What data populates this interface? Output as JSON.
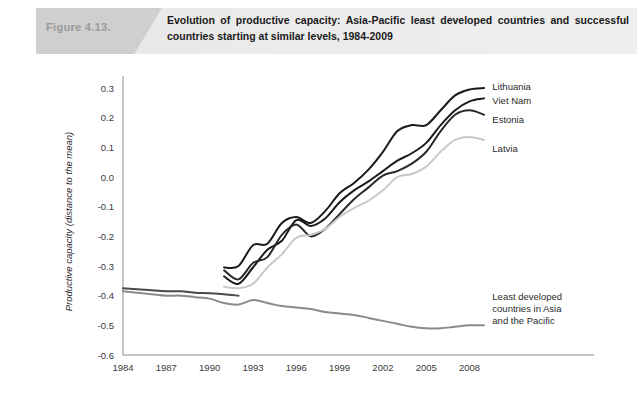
{
  "header": {
    "figure_label": "Figure 4.13.",
    "title": "Evolution of productive capacity: Asia-Pacific least developed countries and successful countries starting at similar levels, 1984-2009",
    "banner_color": "#e9e9e9",
    "tab_color": "#cfcfcf"
  },
  "chart_data": {
    "type": "line",
    "title": "Evolution of productive capacity: Asia-Pacific least developed countries and successful countries starting at similar levels, 1984-2009",
    "xlabel": "",
    "ylabel": "Productive capacity (distance to the mean)",
    "xlim": [
      1984,
      2009
    ],
    "ylim": [
      -0.6,
      0.3
    ],
    "xticks": [
      1984,
      1987,
      1990,
      1993,
      1996,
      1999,
      2002,
      2005,
      2008
    ],
    "yticks": [
      -0.6,
      -0.5,
      -0.4,
      -0.3,
      -0.2,
      -0.1,
      0.0,
      0.1,
      0.2,
      0.3
    ],
    "ytick_labels": [
      "-0.6",
      "-0.5",
      "-0.4",
      "-0.3",
      "-0.2",
      "-0.1",
      "0.0",
      "0.1",
      "0.2",
      "0.3"
    ],
    "grid": false,
    "legend_position": "right-inline-labels",
    "x": [
      1984,
      1985,
      1986,
      1987,
      1988,
      1989,
      1990,
      1991,
      1992,
      1993,
      1994,
      1995,
      1996,
      1997,
      1998,
      1999,
      2000,
      2001,
      2002,
      2003,
      2004,
      2005,
      2006,
      2007,
      2008,
      2009
    ],
    "series": [
      {
        "name": "Lithuania",
        "color": "#1a1a1a",
        "width": 2.0,
        "label_x": 2009.3,
        "label_y": 0.305,
        "x": [
          1991,
          1992,
          1993,
          1994,
          1995,
          1996,
          1997,
          1998,
          1999,
          2000,
          2001,
          2002,
          2003,
          2004,
          2005,
          2006,
          2007,
          2008,
          2009
        ],
        "values": [
          -0.305,
          -0.3,
          -0.23,
          -0.225,
          -0.155,
          -0.135,
          -0.155,
          -0.115,
          -0.055,
          -0.02,
          0.025,
          0.085,
          0.155,
          0.175,
          0.175,
          0.225,
          0.275,
          0.295,
          0.3
        ]
      },
      {
        "name": "Viet Nam",
        "color": "#1a1a1a",
        "width": 2.0,
        "label_x": 2009.3,
        "label_y": 0.258,
        "x": [
          1991,
          1992,
          1993,
          1994,
          1995,
          1996,
          1997,
          1998,
          1999,
          2000,
          2001,
          2002,
          2003,
          2004,
          2005,
          2006,
          2007,
          2008,
          2009
        ],
        "values": [
          -0.335,
          -0.36,
          -0.305,
          -0.245,
          -0.215,
          -0.145,
          -0.165,
          -0.14,
          -0.085,
          -0.045,
          -0.015,
          0.02,
          0.055,
          0.08,
          0.115,
          0.175,
          0.225,
          0.255,
          0.265
        ]
      },
      {
        "name": "Estonia",
        "color": "#2a2a2a",
        "width": 2.0,
        "label_x": 2009.3,
        "label_y": 0.195,
        "x": [
          1991,
          1992,
          1993,
          1994,
          1995,
          1996,
          1997,
          1998,
          1999,
          2000,
          2001,
          2002,
          2003,
          2004,
          2005,
          2006,
          2007,
          2008,
          2009
        ],
        "values": [
          -0.315,
          -0.345,
          -0.29,
          -0.27,
          -0.195,
          -0.16,
          -0.2,
          -0.175,
          -0.125,
          -0.075,
          -0.035,
          0.005,
          0.02,
          0.045,
          0.085,
          0.155,
          0.21,
          0.225,
          0.21
        ]
      },
      {
        "name": "Latvia",
        "color": "#c9c9c9",
        "width": 2.0,
        "label_x": 2009.3,
        "label_y": 0.095,
        "x": [
          1991,
          1992,
          1993,
          1994,
          1995,
          1996,
          1997,
          1998,
          1999,
          2000,
          2001,
          2002,
          2003,
          2004,
          2005,
          2006,
          2007,
          2008,
          2009
        ],
        "values": [
          -0.37,
          -0.375,
          -0.36,
          -0.305,
          -0.26,
          -0.205,
          -0.195,
          -0.175,
          -0.135,
          -0.105,
          -0.08,
          -0.045,
          0.0,
          0.01,
          0.035,
          0.085,
          0.125,
          0.135,
          0.125
        ]
      },
      {
        "name": "Least developed countries in Asia and the Pacific",
        "color": "#8a8a8a",
        "width": 2.0,
        "label_x": 2009.3,
        "label_y": -0.415,
        "x": [
          1984,
          1985,
          1986,
          1987,
          1988,
          1989,
          1990,
          1991,
          1992,
          1993,
          1994,
          1995,
          1996,
          1997,
          1998,
          1999,
          2000,
          2001,
          2002,
          2003,
          2004,
          2005,
          2006,
          2007,
          2008,
          2009
        ],
        "values": [
          -0.385,
          -0.39,
          -0.395,
          -0.4,
          -0.4,
          -0.405,
          -0.41,
          -0.425,
          -0.43,
          -0.415,
          -0.425,
          -0.435,
          -0.44,
          -0.445,
          -0.455,
          -0.46,
          -0.465,
          -0.475,
          -0.485,
          -0.495,
          -0.505,
          -0.51,
          -0.51,
          -0.505,
          -0.5,
          -0.5
        ]
      },
      {
        "name": "early-dark-baseline",
        "color": "#4a4a4a",
        "width": 2.0,
        "label_x": null,
        "label_y": null,
        "x": [
          1984,
          1985,
          1986,
          1987,
          1988,
          1989,
          1990,
          1991,
          1992
        ],
        "values": [
          -0.375,
          -0.378,
          -0.382,
          -0.385,
          -0.385,
          -0.39,
          -0.392,
          -0.395,
          -0.4
        ]
      }
    ],
    "labels": [
      {
        "name": "Lithuania",
        "text": "Lithuania"
      },
      {
        "name": "Viet Nam",
        "text": "Viet Nam"
      },
      {
        "name": "Estonia",
        "text": "Estonia"
      },
      {
        "name": "Latvia",
        "text": "Latvia"
      },
      {
        "name": "Least developed countries",
        "text": "Least developed"
      },
      {
        "name": "ldc-line2",
        "text": "countries in Asia"
      },
      {
        "name": "ldc-line3",
        "text": "and the Pacific"
      }
    ]
  }
}
